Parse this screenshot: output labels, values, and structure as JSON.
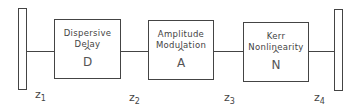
{
  "diagram": {
    "type": "block-diagram",
    "mirrors": [
      {
        "id": "left-mirror"
      },
      {
        "id": "right-mirror"
      }
    ],
    "blocks": [
      {
        "line1": "Dispersive",
        "line2": "Delay",
        "symbol": "D",
        "hat": "^"
      },
      {
        "line1": "Amplitude",
        "line2": "Modulation",
        "symbol": "A",
        "hat": "^"
      },
      {
        "line1": "Kerr",
        "line2": "Nonlinearity",
        "symbol": "N",
        "hat": "^"
      }
    ],
    "positions": [
      {
        "var": "z",
        "sub": "1"
      },
      {
        "var": "z",
        "sub": "2"
      },
      {
        "var": "z",
        "sub": "3"
      },
      {
        "var": "z",
        "sub": "4"
      }
    ]
  }
}
